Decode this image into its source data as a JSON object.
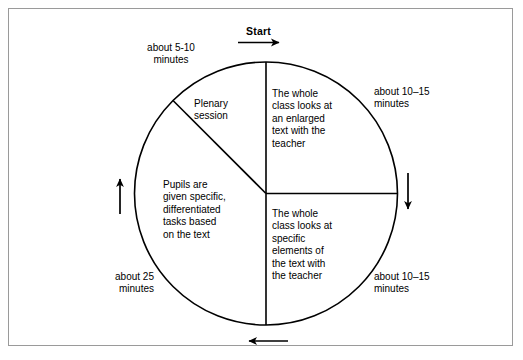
{
  "figure": {
    "title_label": "Start",
    "shape": "cycle-diagram-pie",
    "stroke_color": "#000000",
    "frame_color": "#9a9a9a",
    "background_color": "#ffffff"
  },
  "segments": [
    {
      "id": "whole-class-enlarged-text",
      "text": "The whole\nclass looks at\nan enlarged\ntext with the\nteacher",
      "duration_label": "about 10–15\nminutes"
    },
    {
      "id": "whole-class-specific-elements",
      "text": "The whole\nclass looks at\nspecific\nelements of\nthe text with\nthe teacher",
      "duration_label": "about 10–15\nminutes"
    },
    {
      "id": "pupils-differentiated-tasks",
      "text": "Pupils are\ngiven specific,\ndifferentiated\ntasks based\non the text",
      "duration_label": "about 25\nminutes"
    },
    {
      "id": "plenary-session",
      "text": "Plenary\nsession",
      "duration_label": "about 5-10\nminutes"
    }
  ],
  "arrows": [
    {
      "id": "arrow-top",
      "direction": "right"
    },
    {
      "id": "arrow-right",
      "direction": "down"
    },
    {
      "id": "arrow-bottom",
      "direction": "left"
    },
    {
      "id": "arrow-left",
      "direction": "up"
    }
  ]
}
